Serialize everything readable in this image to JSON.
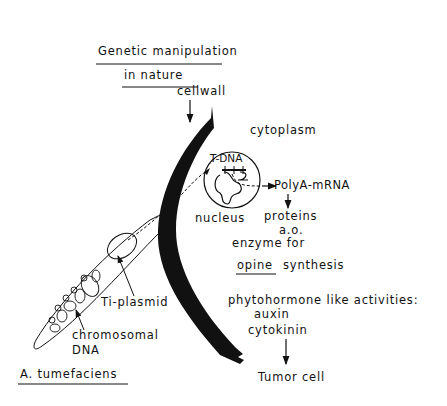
{
  "title": {
    "line1": "Genetic manipulation",
    "line2": "in nature"
  },
  "labels": {
    "cellwall": "cellwall",
    "cytoplasm": "cytoplasm",
    "tdna": "T-DNA",
    "nucleus": "nucleus",
    "polya_mrna": "PolyA-mRNA",
    "proteins": "proteins",
    "ao": "a.o.",
    "enzyme_for": "enzyme for",
    "opine": "opine",
    "synthesis": "synthesis",
    "phytohormone": "phytohormone like activities:",
    "auxin": "auxin",
    "cytokinin": "cytokinin",
    "tumor_cell": "Tumor cell",
    "ti_plasmid": "Ti-plasmid",
    "chromosomal": "chromosomal",
    "dna": "DNA",
    "organism": "A. tumefaciens"
  },
  "flow": [
    "Ti-plasmid",
    "T-DNA",
    "PolyA-mRNA",
    "proteins a.o. enzyme for opine synthesis",
    "phytohormone like activities: auxin, cytokinin",
    "Tumor cell"
  ]
}
